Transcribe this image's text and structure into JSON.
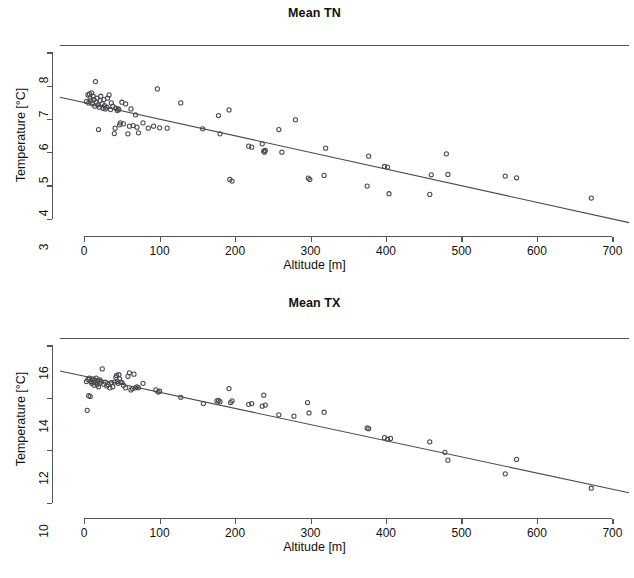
{
  "figure": {
    "panels": [
      "tn",
      "tx"
    ]
  },
  "chart_data": [
    {
      "id": "tn",
      "type": "scatter",
      "title": "Mean TN",
      "xlabel": "Altitude [m]",
      "ylabel": "Temperature [°C]",
      "xlim": [
        -32,
        722
      ],
      "ylim": [
        2.72,
        8.22
      ],
      "xticks": [
        0,
        100,
        200,
        300,
        400,
        500,
        600,
        700
      ],
      "xticklabels": [
        "0",
        "100",
        "200",
        "300",
        "400",
        "500",
        "600",
        "700"
      ],
      "yticks": [
        3,
        4,
        5,
        6,
        7,
        8
      ],
      "yticklabels": [
        "3",
        "4",
        "5",
        "6",
        "7",
        "8"
      ],
      "grid": false,
      "legend": null,
      "marker": "open-circle",
      "point_color": "#4a4b50",
      "line_color": "#4a4b50",
      "x": [
        3,
        5,
        6,
        7,
        8,
        9,
        10,
        11,
        12,
        13,
        14,
        15,
        16,
        17,
        18,
        19,
        20,
        21,
        22,
        24,
        25,
        26,
        27,
        28,
        30,
        31,
        33,
        35,
        36,
        38,
        40,
        41,
        42,
        44,
        45,
        46,
        47,
        48,
        50,
        52,
        55,
        58,
        60,
        62,
        65,
        68,
        70,
        72,
        78,
        85,
        92,
        97,
        100,
        110,
        128,
        157,
        178,
        180,
        192,
        193,
        196,
        218,
        222,
        236,
        238,
        239,
        240,
        258,
        262,
        280,
        297,
        299,
        318,
        320,
        375,
        377,
        398,
        402,
        404,
        458,
        460,
        480,
        482,
        558,
        573,
        672
      ],
      "y": [
        6.52,
        6.72,
        6.48,
        6.75,
        6.62,
        6.55,
        6.78,
        6.45,
        6.68,
        6.58,
        6.38,
        7.12,
        6.5,
        6.62,
        6.42,
        5.68,
        6.35,
        6.55,
        6.68,
        6.46,
        6.32,
        6.58,
        6.4,
        6.3,
        6.35,
        6.62,
        6.72,
        6.28,
        6.48,
        6.38,
        5.56,
        5.72,
        6.32,
        6.25,
        6.3,
        6.28,
        5.82,
        5.88,
        6.5,
        5.85,
        6.45,
        5.55,
        5.78,
        6.3,
        5.8,
        6.12,
        5.75,
        5.58,
        5.88,
        5.72,
        5.78,
        6.9,
        5.73,
        5.72,
        6.48,
        5.7,
        6.1,
        5.55,
        6.27,
        4.18,
        4.13,
        5.18,
        5.15,
        5.25,
        5.03,
        5.0,
        5.05,
        5.68,
        5.0,
        5.97,
        4.22,
        4.18,
        4.3,
        5.12,
        3.98,
        4.88,
        4.57,
        4.55,
        3.75,
        3.73,
        4.32,
        4.95,
        4.33,
        4.28,
        4.23,
        3.62
      ],
      "fit": {
        "x0": -32,
        "y0": 6.65,
        "x1": 722,
        "y1": 2.88
      }
    },
    {
      "id": "tx",
      "type": "scatter",
      "title": "Mean TX",
      "xlabel": "Altitude [m]",
      "ylabel": "Temperature [°C]",
      "xlim": [
        -32,
        722
      ],
      "ylim": [
        9.72,
        16.28
      ],
      "xticks": [
        0,
        100,
        200,
        300,
        400,
        500,
        600,
        700
      ],
      "xticklabels": [
        "0",
        "100",
        "200",
        "300",
        "400",
        "500",
        "600",
        "700"
      ],
      "yticks": [
        10,
        12,
        14,
        16
      ],
      "yticklabels": [
        "10",
        "12",
        "14",
        "16"
      ],
      "grid": false,
      "legend": null,
      "marker": "open-circle",
      "point_color": "#4a4b50",
      "line_color": "#4a4b50",
      "x": [
        3,
        4,
        5,
        6,
        7,
        8,
        9,
        10,
        11,
        12,
        13,
        14,
        15,
        16,
        17,
        18,
        19,
        20,
        21,
        22,
        24,
        26,
        28,
        30,
        32,
        34,
        36,
        38,
        40,
        42,
        43,
        44,
        45,
        46,
        47,
        48,
        50,
        52,
        55,
        58,
        60,
        62,
        64,
        66,
        68,
        70,
        72,
        78,
        95,
        98,
        100,
        128,
        158,
        176,
        178,
        180,
        192,
        194,
        196,
        218,
        222,
        236,
        238,
        240,
        258,
        278,
        296,
        298,
        318,
        375,
        377,
        398,
        402,
        406,
        458,
        478,
        482,
        558,
        573,
        672
      ],
      "y": [
        14.62,
        13.52,
        14.7,
        14.08,
        14.75,
        14.05,
        14.62,
        14.55,
        14.72,
        14.6,
        14.48,
        14.68,
        14.58,
        14.75,
        14.5,
        14.65,
        14.42,
        14.55,
        14.68,
        14.6,
        15.1,
        14.52,
        14.6,
        14.45,
        14.5,
        14.38,
        14.58,
        14.42,
        14.6,
        14.78,
        14.85,
        14.62,
        14.55,
        14.88,
        14.72,
        14.6,
        14.58,
        14.48,
        14.38,
        14.82,
        14.95,
        14.3,
        14.35,
        14.9,
        14.38,
        14.42,
        14.38,
        14.55,
        14.3,
        14.22,
        14.25,
        14.02,
        13.78,
        13.88,
        13.9,
        13.85,
        14.35,
        13.82,
        13.88,
        13.75,
        13.78,
        13.68,
        14.1,
        13.72,
        13.35,
        13.3,
        13.82,
        13.42,
        13.45,
        12.85,
        12.82,
        12.48,
        12.42,
        12.45,
        12.32,
        11.92,
        11.62,
        11.1,
        11.65,
        10.55
      ],
      "fit": {
        "x0": -32,
        "y0": 15.02,
        "x1": 722,
        "y1": 10.38
      }
    }
  ]
}
